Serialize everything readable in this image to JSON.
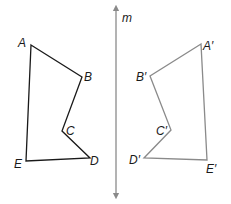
{
  "diagram": {
    "line": {
      "label": "m",
      "color": "#8a8a8a"
    },
    "original": {
      "color": "#1a1a1a",
      "vertices": [
        {
          "label": "A"
        },
        {
          "label": "B"
        },
        {
          "label": "C"
        },
        {
          "label": "D"
        },
        {
          "label": "E"
        }
      ]
    },
    "image": {
      "color": "#8a8a8a",
      "vertices": [
        {
          "label": "A′"
        },
        {
          "label": "B′"
        },
        {
          "label": "C′"
        },
        {
          "label": "D′"
        },
        {
          "label": "E′"
        }
      ]
    }
  }
}
